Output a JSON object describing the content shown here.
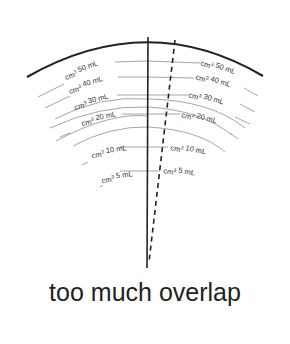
{
  "diagram": {
    "title": "too much overlap",
    "unit_label": "cm3",
    "left_labels": [
      {
        "value": "50 mL"
      },
      {
        "value": "40 mL"
      },
      {
        "value": "30 mL"
      },
      {
        "value": "20 mL"
      },
      {
        "value": "10 mL"
      },
      {
        "value": "5 mL"
      }
    ],
    "right_labels": [
      {
        "value": "50 mL"
      },
      {
        "value": "40 mL"
      },
      {
        "value": "30 mL"
      },
      {
        "value": "20 mL"
      },
      {
        "value": "10 mL"
      },
      {
        "value": "5 mL"
      }
    ],
    "colors": {
      "outer_arc": "#222222",
      "scale_arcs": "#9a9a9a",
      "axis": "#222222",
      "text": "#333333"
    }
  }
}
